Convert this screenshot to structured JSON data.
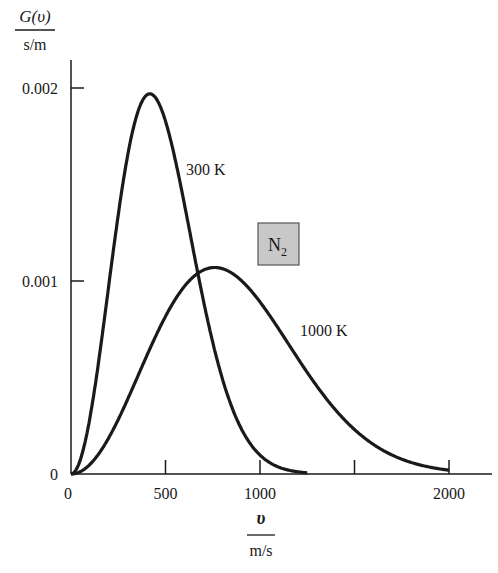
{
  "chart_data": {
    "type": "line",
    "title": "",
    "ylabel_numerator": "G(υ)",
    "ylabel_denominator": "s/m",
    "xlabel_numerator": "υ",
    "xlabel_denominator": "m/s",
    "xlim": [
      0,
      2200
    ],
    "ylim": [
      0,
      0.0021
    ],
    "x_ticks": [
      0,
      500,
      1000,
      1500,
      2000
    ],
    "x_tick_labels": [
      "0",
      "500",
      "1000",
      "",
      "2000"
    ],
    "y_ticks": [
      0,
      0.001,
      0.002
    ],
    "y_tick_labels": [
      "0",
      "0.001",
      "0.002"
    ],
    "grid": false,
    "annotation_box": {
      "text": "N",
      "subscript": "2",
      "fill": "#c8c8c8"
    },
    "series": [
      {
        "name": "300 K",
        "label": "300 K",
        "peak": {
          "x": 417,
          "y": 0.00197
        },
        "x": [
          0,
          100,
          200,
          300,
          400,
          417,
          500,
          600,
          700,
          800,
          900,
          1000,
          1100,
          1200
        ],
        "values": [
          0,
          0.00033,
          0.0011,
          0.00176,
          0.00197,
          0.00197,
          0.0018,
          0.00133,
          0.0008,
          0.00039,
          0.00015,
          4.7e-05,
          1.2e-05,
          2e-06
        ]
      },
      {
        "name": "1000 K",
        "label": "1000 K",
        "peak": {
          "x": 760,
          "y": 0.00107
        },
        "x": [
          0,
          200,
          400,
          600,
          760,
          800,
          1000,
          1200,
          1400,
          1600,
          1800,
          2000
        ],
        "values": [
          0,
          0.00017,
          0.00057,
          0.00094,
          0.00107,
          0.00107,
          0.00093,
          0.00066,
          0.00038,
          0.00018,
          7.5e-05,
          2.6e-05
        ]
      }
    ]
  },
  "colors": {
    "line": "#1a1a1a",
    "box_fill": "#c8c8c8",
    "box_stroke": "#555555"
  }
}
